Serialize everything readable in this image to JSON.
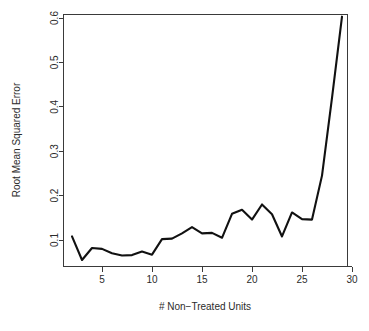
{
  "chart_data": {
    "type": "line",
    "title": "",
    "subtitle": "",
    "xlabel": "# Non−Treated Units",
    "ylabel": "Root Mean Squared Error",
    "xlim": [
      1.2,
      29.8
    ],
    "ylim": [
      0.045,
      0.625
    ],
    "grid": false,
    "legend": null,
    "x_ticks": [
      5,
      10,
      15,
      20,
      25,
      30
    ],
    "x_tick_labels": [
      "5",
      "10",
      "15",
      "20",
      "25",
      "30"
    ],
    "y_ticks": [
      0.1,
      0.2,
      0.3,
      0.4,
      0.5,
      0.6
    ],
    "y_tick_labels": [
      "0.1",
      "0.2",
      "0.3",
      "0.4",
      "0.5",
      "0.6"
    ],
    "series": [
      {
        "name": "rmse",
        "color": "#111111",
        "x": [
          2,
          3,
          4,
          5,
          6,
          7,
          8,
          9,
          10,
          11,
          12,
          13,
          14,
          15,
          16,
          17,
          18,
          19,
          20,
          21,
          22,
          23,
          24,
          25,
          26,
          27,
          28,
          29
        ],
        "values": [
          0.108,
          0.055,
          0.082,
          0.08,
          0.07,
          0.065,
          0.066,
          0.074,
          0.067,
          0.102,
          0.103,
          0.115,
          0.129,
          0.115,
          0.116,
          0.105,
          0.159,
          0.168,
          0.146,
          0.18,
          0.158,
          0.108,
          0.162,
          0.147,
          0.146,
          0.245,
          0.42,
          0.603
        ]
      }
    ]
  },
  "axes": {
    "x_axis_name": "x-axis",
    "y_axis_name": "y-axis"
  }
}
